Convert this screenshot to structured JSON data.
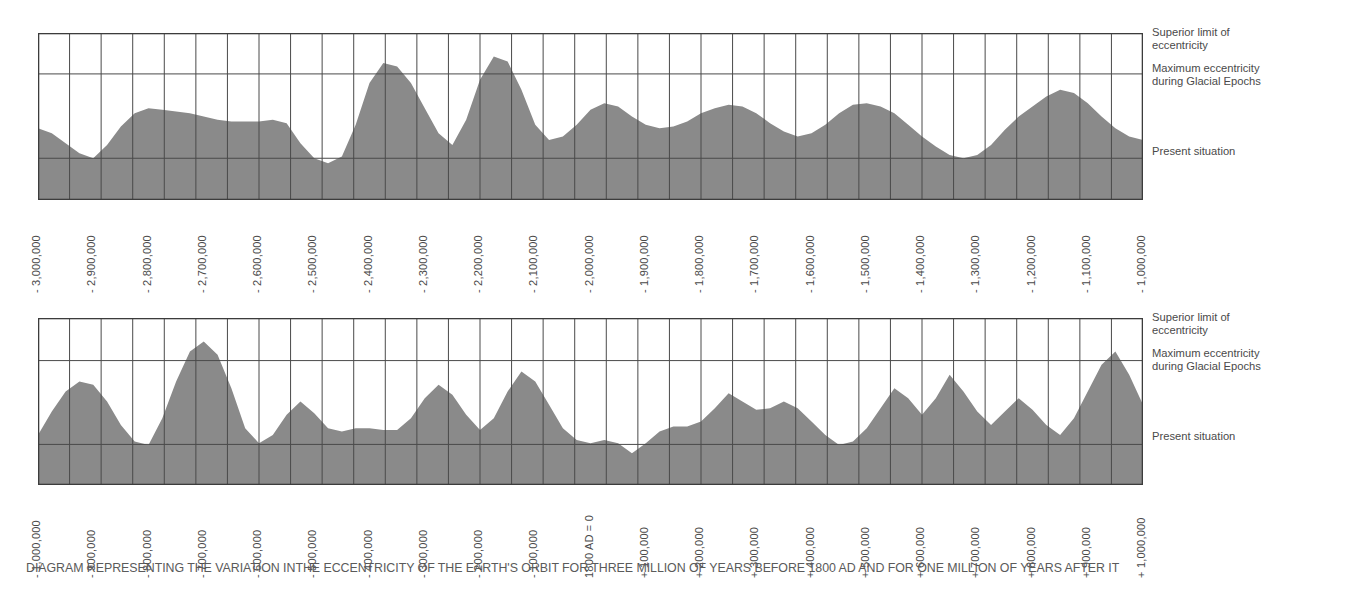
{
  "caption": "DIAGRAM REPRESENTING THE VARIATION INTHE ECCENTRICITY OF THE EARTH'S ORBIT FOR THREE MILLION OF YEARS BEFORE 1800 AD AND FOR  ONE MILLION OF YEARS AFTER IT",
  "reference_labels": {
    "superior_limit": "Superior limit of\neccentricity",
    "maximum_glacial": "Maximum eccentricity\nduring Glacial Epochs",
    "present": "Present situation"
  },
  "colors": {
    "fill": "#8a8a8a",
    "grid": "#4a4a4a",
    "border": "#3c3c3c",
    "text": "#4a4a4a",
    "background": "#ffffff"
  },
  "chart_data": [
    {
      "type": "area",
      "title": "Eccentricity of the Earth's orbit, -3,000,000 to -1,000,000 years",
      "panel": "top",
      "xlabel": "",
      "ylabel": "Eccentricity",
      "xlim": [
        -3000000,
        -1000000
      ],
      "ylim": [
        0,
        1
      ],
      "grid": true,
      "legend_position": "right",
      "reference_lines": [
        {
          "label": "Superior limit of eccentricity",
          "value": 1.0
        },
        {
          "label": "Maximum eccentricity during Glacial Epochs",
          "value": 0.755
        },
        {
          "label": "Present situation",
          "value": 0.25
        }
      ],
      "tick_labels": [
        "- 3,000,000",
        "- 2,900,000",
        "- 2,800,000",
        "- 2,700,000",
        "- 2,600,000",
        "- 2,500,000",
        "- 2,400,000",
        "- 2,300,000",
        "- 2,200,000",
        "- 2,100,000",
        "- 2,000,000",
        "- 1,900,000",
        "- 1,800,000",
        "- 1,700,000",
        "- 1,600,000",
        "- 1,500,000",
        "- 1,400,000",
        "- 1,300,000",
        "- 1,200,000",
        "- 1,100,000",
        "- 1,000,000"
      ],
      "gridline_count": 35,
      "x": [
        -3000000,
        -2975000,
        -2950000,
        -2925000,
        -2900000,
        -2875000,
        -2850000,
        -2825000,
        -2800000,
        -2775000,
        -2750000,
        -2725000,
        -2700000,
        -2675000,
        -2650000,
        -2625000,
        -2600000,
        -2575000,
        -2550000,
        -2525000,
        -2500000,
        -2475000,
        -2450000,
        -2425000,
        -2400000,
        -2375000,
        -2350000,
        -2325000,
        -2300000,
        -2275000,
        -2250000,
        -2225000,
        -2200000,
        -2175000,
        -2150000,
        -2125000,
        -2100000,
        -2075000,
        -2050000,
        -2025000,
        -2000000,
        -1975000,
        -1950000,
        -1925000,
        -1900000,
        -1875000,
        -1850000,
        -1825000,
        -1800000,
        -1775000,
        -1750000,
        -1725000,
        -1700000,
        -1675000,
        -1650000,
        -1625000,
        -1600000,
        -1575000,
        -1550000,
        -1525000,
        -1500000,
        -1475000,
        -1450000,
        -1425000,
        -1400000,
        -1375000,
        -1350000,
        -1325000,
        -1300000,
        -1275000,
        -1250000,
        -1225000,
        -1200000,
        -1175000,
        -1150000,
        -1125000,
        -1100000,
        -1075000,
        -1050000,
        -1025000,
        -1000000
      ],
      "values": [
        0.43,
        0.4,
        0.34,
        0.28,
        0.25,
        0.33,
        0.44,
        0.52,
        0.55,
        0.54,
        0.53,
        0.52,
        0.5,
        0.48,
        0.47,
        0.47,
        0.47,
        0.48,
        0.46,
        0.34,
        0.25,
        0.22,
        0.26,
        0.45,
        0.7,
        0.82,
        0.8,
        0.7,
        0.55,
        0.4,
        0.33,
        0.48,
        0.72,
        0.86,
        0.83,
        0.66,
        0.45,
        0.36,
        0.38,
        0.45,
        0.54,
        0.58,
        0.56,
        0.5,
        0.45,
        0.43,
        0.44,
        0.47,
        0.52,
        0.55,
        0.57,
        0.56,
        0.52,
        0.46,
        0.41,
        0.38,
        0.4,
        0.45,
        0.52,
        0.57,
        0.58,
        0.56,
        0.52,
        0.45,
        0.38,
        0.32,
        0.27,
        0.25,
        0.27,
        0.33,
        0.42,
        0.5,
        0.56,
        0.62,
        0.66,
        0.64,
        0.58,
        0.5,
        0.43,
        0.38,
        0.36
      ]
    },
    {
      "type": "area",
      "title": "Eccentricity of the Earth's orbit, -1,000,000 to +1,000,000 years",
      "panel": "bottom",
      "xlabel": "",
      "ylabel": "Eccentricity",
      "xlim": [
        -1000000,
        1000000
      ],
      "ylim": [
        0,
        1
      ],
      "grid": true,
      "legend_position": "right",
      "reference_lines": [
        {
          "label": "Superior limit of eccentricity",
          "value": 1.0
        },
        {
          "label": "Maximum eccentricity during Glacial Epochs",
          "value": 0.745
        },
        {
          "label": "Present situation",
          "value": 0.243
        }
      ],
      "tick_labels": [
        "- 1,000,000",
        "- 900,000",
        "- 800,000",
        "- 700,000",
        "- 600,000",
        "- 500,000",
        "- 400,000",
        "- 300,000",
        "- 200,000",
        "- 100,000",
        "1800 AD = 0",
        "+ 100,000",
        "+ 200,000",
        "+ 300,000",
        "+ 400,000",
        "+ 500,000",
        "+ 600,000",
        "+ 700,000",
        "+ 800,000",
        "+ 900,000",
        "+ 1,000,000"
      ],
      "gridline_count": 35,
      "x": [
        -1000000,
        -975000,
        -950000,
        -925000,
        -900000,
        -875000,
        -850000,
        -825000,
        -800000,
        -775000,
        -750000,
        -725000,
        -700000,
        -675000,
        -650000,
        -625000,
        -600000,
        -575000,
        -550000,
        -525000,
        -500000,
        -475000,
        -450000,
        -425000,
        -400000,
        -375000,
        -350000,
        -325000,
        -300000,
        -275000,
        -250000,
        -225000,
        -200000,
        -175000,
        -150000,
        -125000,
        -100000,
        -75000,
        -50000,
        -25000,
        0,
        25000,
        50000,
        75000,
        100000,
        125000,
        150000,
        175000,
        200000,
        225000,
        250000,
        275000,
        300000,
        325000,
        350000,
        375000,
        400000,
        425000,
        450000,
        475000,
        500000,
        525000,
        550000,
        575000,
        600000,
        625000,
        650000,
        675000,
        700000,
        725000,
        750000,
        775000,
        800000,
        825000,
        850000,
        875000,
        900000,
        925000,
        950000,
        975000,
        1000000
      ],
      "values": [
        0.3,
        0.44,
        0.56,
        0.62,
        0.6,
        0.5,
        0.36,
        0.26,
        0.24,
        0.4,
        0.62,
        0.8,
        0.86,
        0.78,
        0.58,
        0.34,
        0.25,
        0.3,
        0.42,
        0.5,
        0.43,
        0.34,
        0.32,
        0.34,
        0.34,
        0.33,
        0.33,
        0.4,
        0.52,
        0.6,
        0.54,
        0.42,
        0.33,
        0.4,
        0.56,
        0.68,
        0.62,
        0.48,
        0.34,
        0.27,
        0.25,
        0.27,
        0.25,
        0.19,
        0.25,
        0.32,
        0.35,
        0.35,
        0.38,
        0.46,
        0.55,
        0.5,
        0.45,
        0.46,
        0.5,
        0.46,
        0.38,
        0.3,
        0.24,
        0.26,
        0.34,
        0.46,
        0.58,
        0.52,
        0.42,
        0.52,
        0.66,
        0.56,
        0.44,
        0.36,
        0.44,
        0.52,
        0.45,
        0.36,
        0.3,
        0.4,
        0.56,
        0.72,
        0.8,
        0.66,
        0.48
      ]
    }
  ]
}
